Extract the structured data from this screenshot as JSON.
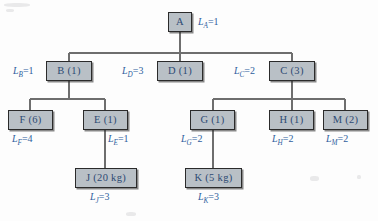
{
  "diagram": {
    "colors": {
      "node_fill": "#b9c0c6",
      "node_border": "#2b2b2b",
      "node_text": "#2d4a73",
      "label_text": "#2f5f9e",
      "line": "#6e6e6e",
      "background": "#fdfdfd"
    },
    "nodes": [
      {
        "id": "A",
        "label": "A",
        "lead_label": "L",
        "lead_sub": "A",
        "lead_value": "1"
      },
      {
        "id": "B",
        "label": "B (1)",
        "lead_label": "L",
        "lead_sub": "B",
        "lead_value": "1"
      },
      {
        "id": "D",
        "label": "D (1)",
        "lead_label": "L",
        "lead_sub": "D",
        "lead_value": "3"
      },
      {
        "id": "C",
        "label": "C (3)",
        "lead_label": "L",
        "lead_sub": "C",
        "lead_value": "2"
      },
      {
        "id": "F",
        "label": "F (6)",
        "lead_label": "L",
        "lead_sub": "F",
        "lead_value": "4"
      },
      {
        "id": "E",
        "label": "E (1)",
        "lead_label": "L",
        "lead_sub": "E",
        "lead_value": "1"
      },
      {
        "id": "G",
        "label": "G (1)",
        "lead_label": "L",
        "lead_sub": "G",
        "lead_value": "2"
      },
      {
        "id": "H",
        "label": "H (1)",
        "lead_label": "L",
        "lead_sub": "H",
        "lead_value": "2"
      },
      {
        "id": "M",
        "label": "M (2)",
        "lead_label": "L",
        "lead_sub": "M",
        "lead_value": "2"
      },
      {
        "id": "J",
        "label": "J (20 kg)",
        "lead_label": "L",
        "lead_sub": "J",
        "lead_value": "3"
      },
      {
        "id": "K",
        "label": "K (5 kg)",
        "lead_label": "L",
        "lead_sub": "K",
        "lead_value": "3"
      }
    ],
    "edges": [
      {
        "from": "A",
        "to": "B"
      },
      {
        "from": "A",
        "to": "D"
      },
      {
        "from": "A",
        "to": "C"
      },
      {
        "from": "B",
        "to": "F"
      },
      {
        "from": "B",
        "to": "E"
      },
      {
        "from": "C",
        "to": "G"
      },
      {
        "from": "C",
        "to": "H"
      },
      {
        "from": "C",
        "to": "M"
      },
      {
        "from": "E",
        "to": "J"
      },
      {
        "from": "G",
        "to": "K"
      }
    ],
    "equals": "="
  }
}
